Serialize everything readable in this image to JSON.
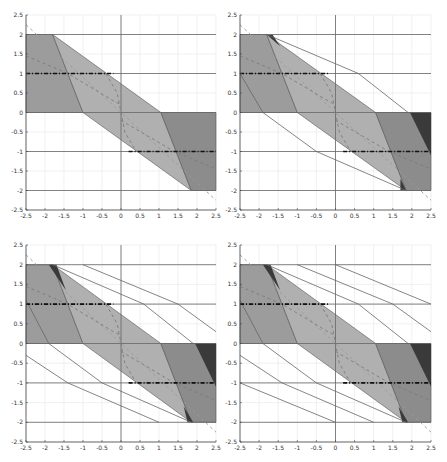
{
  "chart_data": {
    "type": "area",
    "layout": "2x2 grid of panels",
    "shared_axes": {
      "xlim": [
        -2.5,
        2.5
      ],
      "ylim": [
        -2.5,
        2.5
      ],
      "xticks": [
        "-2.5",
        "-2",
        "-1.5",
        "-1",
        "-0.5",
        "0",
        "0.5",
        "1",
        "1.5",
        "2",
        "2.5"
      ],
      "yticks": [
        "2.5",
        "2",
        "1.5",
        "1",
        "0.5",
        "0",
        "-0.5",
        "-1",
        "-1.5",
        "-2",
        "-2.5"
      ],
      "grid": true,
      "title": "",
      "xlabel": "",
      "ylabel": ""
    },
    "colors": {
      "left_region": "#9c9c9c",
      "middle_region": "#b0b0b0",
      "right_region": "#8c8c8c",
      "sliver_region": "#3a3a3a",
      "lines": "#666666",
      "dashdot": "#111111",
      "dashed_curve": "#7a7a7a",
      "grid": "#e6e6e6"
    },
    "common_elements": {
      "horizontal_lines_y": [
        2,
        1,
        0,
        -1,
        -2
      ],
      "vertical_line_x": 0,
      "filled_regions": [
        {
          "name": "left",
          "points": [
            [
              -2.5,
              2
            ],
            [
              -1.8,
              2
            ],
            [
              -1.0,
              0
            ],
            [
              -2.5,
              0
            ]
          ]
        },
        {
          "name": "middle",
          "points": [
            [
              -1.8,
              2
            ],
            [
              1.05,
              0
            ],
            [
              1.85,
              -2
            ],
            [
              -1.0,
              0
            ]
          ]
        },
        {
          "name": "right",
          "points": [
            [
              1.05,
              0
            ],
            [
              2.5,
              0
            ],
            [
              2.5,
              -2
            ],
            [
              1.85,
              -2
            ]
          ]
        }
      ],
      "dashdot_segments": [
        {
          "y": 1,
          "x": [
            -2.5,
            -0.2
          ]
        },
        {
          "y": -1,
          "x": [
            0.2,
            2.5
          ]
        }
      ],
      "dashed_diagonal": [
        [
          -2.5,
          2.25
        ],
        [
          2.5,
          -2.25
        ]
      ],
      "dashed_curves": [
        [
          [
            -2.5,
            1.45
          ],
          [
            -1.4,
            1.0
          ],
          [
            -0.2,
            0.3
          ],
          [
            0,
            0.2
          ]
        ],
        [
          [
            -0.4,
            1.0
          ],
          [
            -0.1,
            0.5
          ],
          [
            0,
            0.0
          ],
          [
            0.1,
            -0.5
          ],
          [
            0.4,
            -1.0
          ]
        ],
        [
          [
            0,
            -0.2
          ],
          [
            1.4,
            -1.0
          ],
          [
            2.5,
            -1.45
          ]
        ]
      ]
    },
    "panels": [
      {
        "id": "top-left",
        "slivers": [],
        "extra_polylines": []
      },
      {
        "id": "top-right",
        "slivers": [
          {
            "points": [
              [
                -1.8,
                2
              ],
              [
                -1.65,
                2
              ],
              [
                -1.45,
                1.7
              ]
            ]
          },
          {
            "points": [
              [
                1.95,
                0
              ],
              [
                2.5,
                0
              ],
              [
                2.5,
                -1.1
              ]
            ]
          },
          {
            "points": [
              [
                1.7,
                -1.7
              ],
              [
                1.85,
                -2
              ],
              [
                1.7,
                -2
              ]
            ]
          }
        ],
        "extra_polylines": [
          [
            [
              -1.8,
              2
            ],
            [
              0.6,
              1.0
            ],
            [
              1.9,
              0
            ]
          ],
          [
            [
              -2.5,
              1.0
            ],
            [
              -1.9,
              0
            ],
            [
              -0.5,
              -1.0
            ],
            [
              1.85,
              -2
            ]
          ]
        ]
      },
      {
        "id": "bottom-left",
        "slivers": [
          {
            "points": [
              [
                -1.9,
                2
              ],
              [
                -1.7,
                2
              ],
              [
                -1.45,
                1.35
              ]
            ]
          },
          {
            "points": [
              [
                1.95,
                0
              ],
              [
                2.5,
                0
              ],
              [
                2.5,
                -1.1
              ]
            ]
          },
          {
            "points": [
              [
                1.65,
                -1.6
              ],
              [
                1.9,
                -2
              ],
              [
                1.75,
                -2
              ]
            ]
          }
        ],
        "extra_polylines": [
          [
            [
              -1.8,
              2
            ],
            [
              0.6,
              1.0
            ],
            [
              1.9,
              0
            ]
          ],
          [
            [
              -2.5,
              1.1
            ],
            [
              -1.9,
              0
            ],
            [
              -0.5,
              -1.0
            ],
            [
              1.85,
              -2
            ]
          ],
          [
            [
              -1.0,
              2
            ],
            [
              1.5,
              1.0
            ],
            [
              2.5,
              0.3
            ]
          ],
          [
            [
              -2.5,
              -0.3
            ],
            [
              -1.4,
              -1.0
            ],
            [
              1.0,
              -2
            ]
          ]
        ]
      },
      {
        "id": "bottom-right",
        "slivers": [
          {
            "points": [
              [
                -1.9,
                2
              ],
              [
                -1.7,
                2
              ],
              [
                -1.45,
                1.35
              ]
            ]
          },
          {
            "points": [
              [
                1.95,
                0
              ],
              [
                2.5,
                0
              ],
              [
                2.5,
                -1.1
              ]
            ]
          },
          {
            "points": [
              [
                1.65,
                -1.6
              ],
              [
                1.9,
                -2
              ],
              [
                1.75,
                -2
              ]
            ]
          }
        ],
        "extra_polylines": [
          [
            [
              -1.8,
              2
            ],
            [
              0.6,
              1.0
            ],
            [
              1.9,
              0
            ]
          ],
          [
            [
              -2.5,
              1.1
            ],
            [
              -1.9,
              0
            ],
            [
              -0.5,
              -1.0
            ],
            [
              1.85,
              -2
            ]
          ],
          [
            [
              -1.0,
              2
            ],
            [
              1.5,
              1.0
            ],
            [
              2.5,
              0.3
            ]
          ],
          [
            [
              -2.5,
              -0.3
            ],
            [
              -1.4,
              -1.0
            ],
            [
              1.0,
              -2
            ]
          ],
          [
            [
              0,
              2
            ],
            [
              2.5,
              1.0
            ]
          ],
          [
            [
              -2.5,
              -1.0
            ],
            [
              0,
              -2
            ]
          ]
        ]
      }
    ]
  },
  "panel_frames": [
    {
      "left": 26,
      "top": 15,
      "width": 190,
      "height": 195
    },
    {
      "left": 240,
      "top": 15,
      "width": 191,
      "height": 195
    },
    {
      "left": 26,
      "top": 245,
      "width": 190,
      "height": 197
    },
    {
      "left": 240,
      "top": 245,
      "width": 191,
      "height": 197
    }
  ]
}
